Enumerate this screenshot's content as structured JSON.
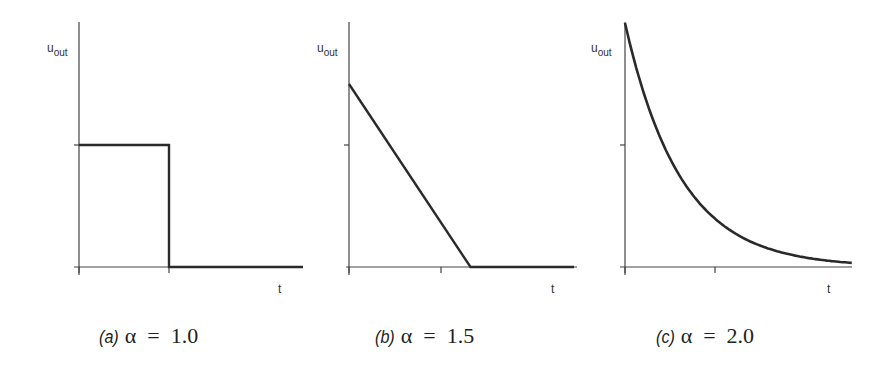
{
  "chart_data": [
    {
      "type": "line",
      "panel": "a",
      "caption_tag": "(a)",
      "caption_expr": "α  =  1.0",
      "alpha": 1.0,
      "ylabel": "u_out",
      "ylabel_main": "u",
      "ylabel_sub": "out",
      "xlabel": "t",
      "y_ticks": [
        0,
        1
      ],
      "x_ticks": [
        0,
        1
      ],
      "grid": false,
      "shape": "rectangular pulse",
      "points": [
        [
          0,
          1
        ],
        [
          1,
          1
        ],
        [
          1,
          0
        ],
        [
          2.5,
          0
        ]
      ]
    },
    {
      "type": "line",
      "panel": "b",
      "caption_tag": "(b)",
      "caption_expr": "α  =  1.5",
      "alpha": 1.5,
      "ylabel": "u_out",
      "ylabel_main": "u",
      "ylabel_sub": "out",
      "xlabel": "t",
      "y_ticks": [
        0,
        1
      ],
      "x_ticks": [
        0,
        1
      ],
      "grid": false,
      "shape": "linear ramp down",
      "points": [
        [
          0,
          1.5
        ],
        [
          1.35,
          0
        ],
        [
          2.5,
          0
        ]
      ]
    },
    {
      "type": "line",
      "panel": "c",
      "caption_tag": "(c)",
      "caption_expr": "α  =  2.0",
      "alpha": 2.0,
      "ylabel": "u_out",
      "ylabel_main": "u",
      "ylabel_sub": "out",
      "xlabel": "t",
      "y_ticks": [
        0,
        1
      ],
      "x_ticks": [
        0,
        1
      ],
      "grid": false,
      "shape": "exponential decay",
      "points": [
        [
          0,
          2.0
        ],
        [
          0.25,
          1.33
        ],
        [
          0.5,
          0.89
        ],
        [
          0.75,
          0.6
        ],
        [
          1.0,
          0.4
        ],
        [
          1.25,
          0.27
        ],
        [
          1.5,
          0.18
        ],
        [
          1.75,
          0.12
        ],
        [
          2.0,
          0.08
        ],
        [
          2.25,
          0.05
        ],
        [
          2.5,
          0.02
        ]
      ]
    }
  ]
}
